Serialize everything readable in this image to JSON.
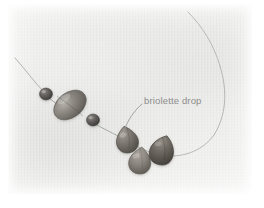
{
  "figure": {
    "kind": "photograph-with-annotation",
    "background_color": "#ececeb",
    "plate": {
      "x": 8,
      "y": 4,
      "width": 244,
      "height": 190
    }
  },
  "annotations": [
    {
      "id": "briolette-drop",
      "label": "briolette drop",
      "text_color": "#8d8d8d",
      "text_x": 144,
      "text_y": 95,
      "leader": {
        "from_x": 142,
        "from_y": 104,
        "to_x": 124,
        "to_y": 130,
        "color": "#9a9a98"
      }
    }
  ],
  "components": {
    "wire": {
      "name": "beading-wire",
      "color": "#a6a6a4",
      "width": 0.9
    },
    "beads": [
      {
        "name": "round-spacer-bead-left",
        "shape": "round",
        "cx": 46,
        "cy": 94,
        "rx": 6.5,
        "ry": 6.0,
        "color": "#5e5a57"
      },
      {
        "name": "large-oval-focal-bead",
        "shape": "oval",
        "cx": 70,
        "cy": 105,
        "rx": 18,
        "ry": 12.5,
        "rotation": -38,
        "color": "#84807b"
      },
      {
        "name": "round-spacer-bead-right",
        "shape": "round",
        "cx": 93,
        "cy": 120,
        "rx": 6.5,
        "ry": 6.0,
        "color": "#5b5754"
      },
      {
        "name": "briolette-drop-1",
        "shape": "teardrop",
        "cx": 127,
        "cy": 139,
        "rx": 11,
        "ry": 13,
        "rotation": -12,
        "color": "#7b766f"
      },
      {
        "name": "briolette-drop-2",
        "shape": "teardrop",
        "cx": 140,
        "cy": 160,
        "rx": 11,
        "ry": 13,
        "rotation": 8,
        "color": "#8a857e"
      },
      {
        "name": "briolette-drop-3",
        "shape": "teardrop",
        "cx": 162,
        "cy": 150,
        "rx": 11.5,
        "ry": 14,
        "rotation": 18,
        "color": "#6e6962"
      }
    ]
  }
}
